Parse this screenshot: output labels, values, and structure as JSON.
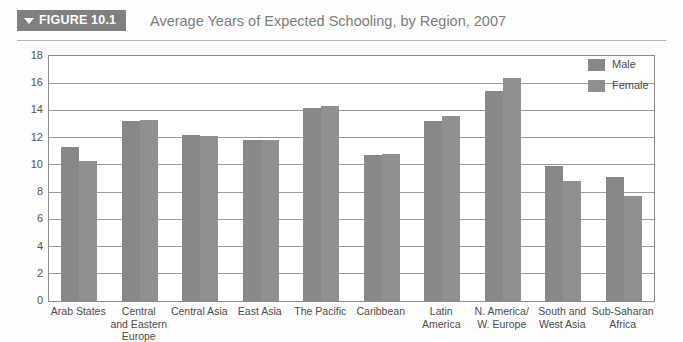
{
  "header": {
    "badge_label": "FIGURE 10.1",
    "badge_icon": "triangle-down-icon",
    "title": "Average Years of Expected Schooling, by Region, 2007",
    "badge_color": "#808080",
    "title_color": "#7c7c7c"
  },
  "legend": {
    "position": "top-right",
    "items": [
      {
        "label": "Male",
        "color": "#888888"
      },
      {
        "label": "Female",
        "color": "#909090"
      }
    ]
  },
  "axis": {
    "y_ticks": [
      "18",
      "16",
      "14",
      "12",
      "10",
      "8",
      "6",
      "4",
      "2",
      "0"
    ]
  },
  "chart_data": {
    "type": "bar",
    "title": "Average Years of Expected Schooling, by Region, 2007",
    "xlabel": "",
    "ylabel": "",
    "ylim": [
      0,
      18
    ],
    "ytick_step": 2,
    "grid": true,
    "legend_position": "top-right",
    "categories": [
      "Arab States",
      "Central\nand Eastern\nEurope",
      "Central Asia",
      "East Asia",
      "The Pacific",
      "Caribbean",
      "Latin\nAmerica",
      "N. America/\nW. Europe",
      "South and\nWest Asia",
      "Sub-Saharan\nAfrica"
    ],
    "series": [
      {
        "name": "Male",
        "color": "#888888",
        "values": [
          11.3,
          13.2,
          12.2,
          11.8,
          14.2,
          10.7,
          13.2,
          15.4,
          9.9,
          9.1
        ]
      },
      {
        "name": "Female",
        "color": "#909090",
        "values": [
          10.3,
          13.3,
          12.1,
          11.8,
          14.3,
          10.8,
          13.6,
          16.4,
          8.8,
          7.7
        ]
      }
    ]
  }
}
